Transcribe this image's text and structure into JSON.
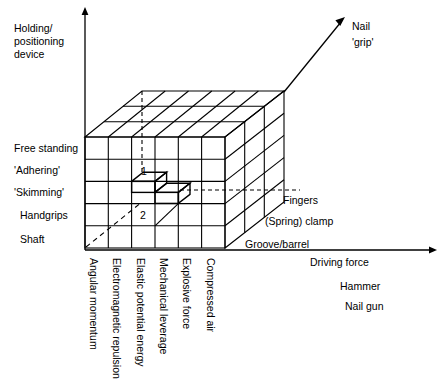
{
  "diagram": {
    "title_axes": {
      "y_axis_label": "Holding/\npositioning\ndevice",
      "x_axis_label": "Driving force",
      "z_axis_label": "Nail\n'grip'"
    },
    "y_axis": {
      "name": "Holding/positioning device",
      "line1": "Holding/",
      "line2": "positioning",
      "line3": "device",
      "categories": [
        "Free standing",
        "'Adhering'",
        "'Skimming'",
        "Handgrips",
        "Shaft"
      ]
    },
    "x_axis": {
      "name": "Driving force",
      "categories": [
        "Angular momentum",
        "Electromagnetic repulsion",
        "Elastic potential energy",
        "Mechanical leverage",
        "Explosive force",
        "Compressed air"
      ],
      "extra_labels": [
        "Driving force",
        "Hammer",
        "Nail gun"
      ]
    },
    "z_axis": {
      "name": "Nail 'grip'",
      "line1": "Nail",
      "line2": "'grip'",
      "categories": [
        "Fingers",
        "(Spring) clamp",
        "Groove/barrel"
      ]
    },
    "highlighted_cells": [
      {
        "label": "1"
      },
      {
        "label": "2"
      }
    ],
    "grid": {
      "front_columns": 6,
      "front_rows": 5,
      "depth_layers": 3
    },
    "colors": {
      "stroke": "#000000",
      "background": "#ffffff"
    }
  }
}
